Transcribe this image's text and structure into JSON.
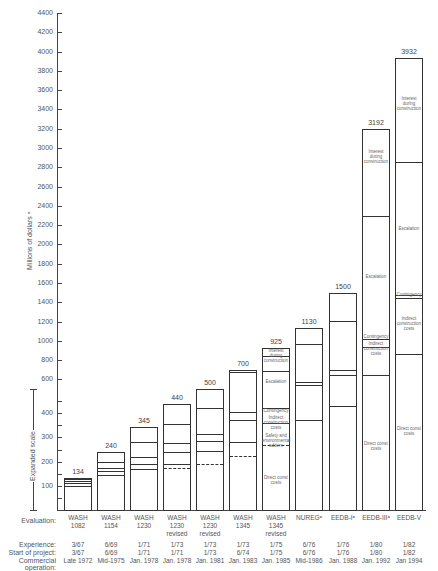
{
  "chart_data": {
    "type": "bar",
    "subtype": "stacked",
    "title": "",
    "ylabel": "Millions of dollars",
    "ylabel_footnote": "a",
    "expanded_scale_label": "Expanded scale",
    "ylim": [
      0,
      4400
    ],
    "yticks_upper": [
      600,
      800,
      1000,
      1200,
      1400,
      1600,
      1800,
      2000,
      2200,
      2400,
      2600,
      2800,
      3000,
      3200,
      3400,
      3600,
      3800,
      4000,
      4200,
      4400
    ],
    "yticks_expanded": [
      100,
      200,
      300,
      400,
      500
    ],
    "grid": false,
    "row_labels": {
      "evaluation": "Evaluation:",
      "experience": "Experience:",
      "start": "Start of project:",
      "commercial": "Commercial operation:"
    },
    "categories": [
      {
        "eval": [
          "WASH",
          "1082"
        ],
        "total": 134,
        "experience": "3/67",
        "start": "3/67",
        "commercial": "Late 1972"
      },
      {
        "eval": [
          "WASH",
          "1154"
        ],
        "total": 240,
        "experience": "6/69",
        "start": "6/69",
        "commercial": "Mid-1975"
      },
      {
        "eval": [
          "WASH",
          "1230"
        ],
        "total": 345,
        "experience": "1/71",
        "start": "1/71",
        "commercial": "Jan. 1978"
      },
      {
        "eval": [
          "WASH",
          "1230",
          "revised"
        ],
        "total": 440,
        "experience": "1/73",
        "start": "1/71",
        "commercial": "Jan. 1978"
      },
      {
        "eval": [
          "WASH",
          "1230",
          "revised"
        ],
        "total": 500,
        "experience": "1/73",
        "start": "1/73",
        "commercial": "Jan. 1981"
      },
      {
        "eval": [
          "WASH",
          "1345"
        ],
        "total": 700,
        "experience": "1/73",
        "start": "6/74",
        "commercial": "Jan. 1983"
      },
      {
        "eval": [
          "WASH",
          "1345",
          "revised"
        ],
        "total": 925,
        "experience": "1/75",
        "start": "1/75",
        "commercial": "Jan. 1985"
      },
      {
        "eval": [
          "NUREGᵃ"
        ],
        "total": 1130,
        "experience": "6/76",
        "start": "6/76",
        "commercial": "Mid-1986"
      },
      {
        "eval": [
          "EEDB-Iᵃ"
        ],
        "total": 1500,
        "experience": "1/76",
        "start": "1/76",
        "commercial": "Jan. 1988"
      },
      {
        "eval": [
          "EEDB-IIIᵃ"
        ],
        "total": 3192,
        "experience": "1/80",
        "start": "1/80",
        "commercial": "Jan. 1992"
      },
      {
        "eval": [
          "EEDB-V"
        ],
        "total": 3932,
        "experience": "1/82",
        "start": "1/82",
        "commercial": "Jan 1994"
      }
    ],
    "totals": [
      134,
      240,
      345,
      440,
      500,
      700,
      925,
      1130,
      1500,
      3192,
      3932
    ],
    "segment_boundaries_approx": [
      {
        "solid": [
          100,
          110,
          120,
          128
        ],
        "dashed": []
      },
      {
        "solid": [
          145,
          160,
          175,
          200
        ],
        "dashed": []
      },
      {
        "solid": [
          170,
          190,
          220,
          280
        ],
        "dashed": []
      },
      {
        "solid": [
          190,
          240,
          275,
          355
        ],
        "dashed": [
          175
        ]
      },
      {
        "solid": [
          245,
          285,
          315,
          420
        ],
        "dashed": [
          190
        ]
      },
      {
        "solid": [
          280,
          370,
          405,
          680
        ],
        "dashed": [
          225
        ]
      },
      {
        "solid": [
          360,
          420,
          690,
          840
        ],
        "dashed": [
          270
        ]
      },
      {
        "solid": [
          370,
          540,
          570,
          970
        ],
        "dashed": []
      },
      {
        "solid": [
          430,
          650,
          700,
          1210
        ],
        "dashed": []
      },
      {
        "solid": [
          650,
          940,
          1020,
          2290
        ],
        "dashed": []
      },
      {
        "solid": [
          860,
          1440,
          1480,
          2850
        ],
        "dashed": []
      }
    ],
    "segment_labels": {
      "wash1345rev": [
        "Direct const costs",
        "Safety and environmental adders",
        "Indirect construction costs",
        "Contingency",
        "Escalation",
        "Interest during construction"
      ],
      "eedb3": [
        "Direct const costs",
        "Indirect construction costs",
        "Contingency",
        "Escalation",
        "Interest during construction"
      ],
      "eedbv": [
        "Direct const costs",
        "Indirect construction costs",
        "Contingency",
        "Escalation",
        "Interest during construction"
      ]
    }
  },
  "labels": {
    "ylabel": "Millions of dollars ᵃ",
    "expanded": "Expanded scale",
    "seg": {
      "idc": "Interest during construction",
      "esc": "Escalation",
      "cont": "Contingency",
      "ind": "Indirect construction costs",
      "safety": "Safety and environmental adders",
      "direct": "Direct const costs"
    }
  }
}
